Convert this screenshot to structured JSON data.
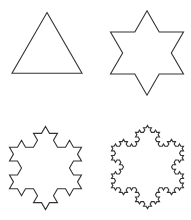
{
  "figure": {
    "background": "#ffffff",
    "stroke_color": "#333333",
    "stroke_width": 1.1
  },
  "snowflakes": [
    {
      "name": "koch-iteration-0",
      "iteration": 0,
      "cx": 47,
      "cy": 53,
      "side": 70
    },
    {
      "name": "koch-iteration-1",
      "iteration": 1,
      "cx": 147,
      "cy": 53,
      "side": 73
    },
    {
      "name": "koch-iteration-2",
      "iteration": 2,
      "cx": 45.5,
      "cy": 168,
      "side": 72
    },
    {
      "name": "koch-iteration-3",
      "iteration": 3,
      "cx": 147.5,
      "cy": 167,
      "side": 72
    }
  ]
}
